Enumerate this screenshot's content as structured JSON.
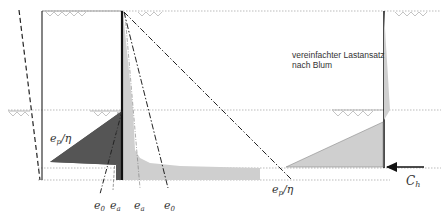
{
  "diagram": {
    "title_note_line1": "vereinfachter Lastansatz",
    "title_note_line2": "nach Blum",
    "labels": {
      "ep_eta_left": "e",
      "ep_eta_left_sub": "p",
      "ep_eta_left_suffix": "/η",
      "e0_left": "e",
      "e0_left_sub": "0",
      "ea_left": "e",
      "ea_left_sub": "a",
      "ea_mid": "e",
      "ea_mid_sub": "a",
      "e0_mid": "e",
      "e0_mid_sub": "0",
      "ep_eta_right": "e",
      "ep_eta_right_sub": "p",
      "ep_eta_right_suffix": "/η",
      "ch": "C",
      "ch_sub": "h"
    },
    "colors": {
      "dark_fill": "#555555",
      "light_fill": "#cccccc",
      "wall": "#111111",
      "dotted": "#bbbbbb"
    }
  }
}
